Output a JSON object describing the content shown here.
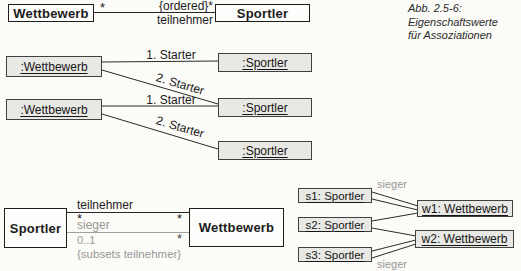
{
  "caption": {
    "line1": "Abb. 2.5-6:",
    "line2": "Eigenschaftswerte",
    "line3": "für Assoziationen"
  },
  "class_diagram_top": {
    "left_class": "Wettbewerb",
    "right_class": "Sportler",
    "left_multiplicity": "*",
    "right_multiplicity": "{ordered}*",
    "association_name": "teilnehmer"
  },
  "object_diagram_top": {
    "wettbewerb_objects": [
      ":Wettbewerb",
      ":Wettbewerb"
    ],
    "sportler_objects": [
      ":Sportler",
      ":Sportler",
      ":Sportler"
    ],
    "links": [
      {
        "label": "1. Starter"
      },
      {
        "label": "2. Starter"
      },
      {
        "label": "1. Starter"
      },
      {
        "label": "2. Starter"
      }
    ]
  },
  "class_diagram_bottom": {
    "left_class": "Sportler",
    "right_class": "Wettbewerb",
    "teilnehmer": {
      "name": "teilnehmer",
      "left_mult": "*",
      "right_mult": "*"
    },
    "sieger": {
      "name": "sieger",
      "left_mult": "0..1",
      "right_mult": "*",
      "constraint": "{subsets teilnehmer}"
    }
  },
  "object_diagram_bottom": {
    "sportler_objects": [
      "s1: Sportler",
      "s2: Sportler",
      "s3: Sportler"
    ],
    "wettbewerb_objects": [
      "w1: Wettbewerb",
      "w2: Wettbewerb"
    ],
    "sieger_label_top": "sieger",
    "sieger_label_bottom": "sieger"
  },
  "colors": {
    "object_box_fill": "#e8e8e5",
    "class_box_fill": "#fdfdfb",
    "gray_text": "#989894",
    "line_color": "#2a2a28"
  }
}
